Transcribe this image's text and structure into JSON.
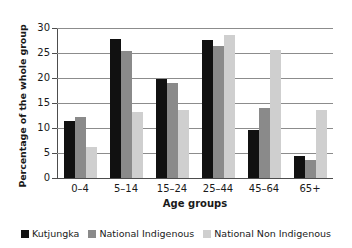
{
  "chart_data": {
    "type": "bar",
    "title": "",
    "subtitle": "",
    "xlabel": "Age groups",
    "ylabel": "Percentage of the whole group",
    "categories": [
      "0–4",
      "5–14",
      "15–24",
      "25–44",
      "45–64",
      "65+"
    ],
    "series": [
      {
        "name": "Kutjungka",
        "color": "#111111",
        "values": [
          11.5,
          27.8,
          19.8,
          27.7,
          9.7,
          4.5
        ]
      },
      {
        "name": "National Indigenous",
        "color": "#8a8a8a",
        "values": [
          12.2,
          25.4,
          19.0,
          26.5,
          14.0,
          3.6
        ]
      },
      {
        "name": "National Non Indigenous",
        "color": "#cfcfcf",
        "values": [
          6.2,
          13.2,
          13.6,
          28.6,
          25.6,
          13.6
        ]
      }
    ],
    "ylim": [
      0,
      30
    ],
    "yticks": [
      0,
      5,
      10,
      15,
      20,
      25,
      30
    ],
    "ytick_labels": [
      "0",
      "5",
      "10",
      "15",
      "20",
      "25",
      "30"
    ],
    "grid": true,
    "grid_axis": "y",
    "legend_position": "bottom"
  }
}
